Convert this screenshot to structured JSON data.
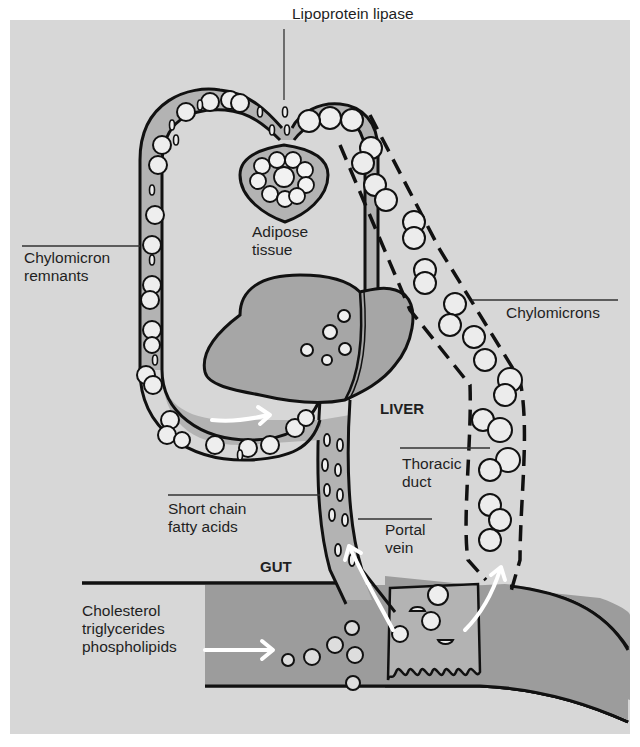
{
  "figure": {
    "background_color": "#d7d7d7",
    "vessel_fill": "#b3b3b3",
    "organ_fill": "#a6a6a6",
    "gut_fill": "#9c9c9c",
    "stroke_color": "#111111",
    "arrow_color": "#ffffff"
  },
  "labels": {
    "lipoprotein_lipase": "Lipoprotein lipase",
    "adipose_tissue": "Adipose\ntissue",
    "chylomicron_remnants": "Chylomicron\nremnants",
    "chylomicrons": "Chylomicrons",
    "liver": "LIVER",
    "thoracic_duct": "Thoracic\nduct",
    "short_chain_fatty_acids": "Short chain\nfatty acids",
    "portal_vein": "Portal\nvein",
    "gut": "GUT",
    "dietary_lipids": "Cholesterol\ntriglycerides\nphospholipids"
  },
  "arrows": [
    {
      "name": "dietary-lipids-into-gut-arrow",
      "direction": "right"
    },
    {
      "name": "portal-vein-upflow-arrow",
      "direction": "up-left"
    },
    {
      "name": "thoracic-duct-upflow-arrow",
      "direction": "up-right"
    },
    {
      "name": "remnants-to-liver-arrow",
      "direction": "right"
    }
  ]
}
